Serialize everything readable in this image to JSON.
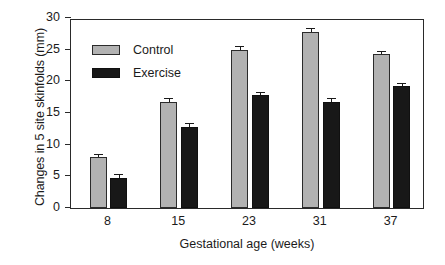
{
  "chart_data": {
    "type": "bar",
    "title": "",
    "xlabel": "Gestational age (weeks)",
    "ylabel": "Changes in 5 site skinfolds (mm)",
    "categories": [
      "8",
      "15",
      "23",
      "31",
      "37"
    ],
    "ylim": [
      0,
      30
    ],
    "yticks": [
      0,
      5,
      10,
      15,
      20,
      25,
      30
    ],
    "ytick_labels": [
      "0",
      "5",
      "10",
      "15",
      "20",
      "25",
      "30"
    ],
    "grid": false,
    "legend_position": "upper-left-inside",
    "series": [
      {
        "name": "Control",
        "color": "#b2b2b2",
        "values": [
          8.0,
          16.8,
          24.9,
          27.8,
          24.3
        ],
        "errors": [
          0.4,
          0.4,
          0.5,
          0.45,
          0.4
        ]
      },
      {
        "name": "Exercise",
        "color": "#181818",
        "values": [
          4.8,
          12.8,
          17.8,
          16.8,
          19.3
        ],
        "errors": [
          0.35,
          0.4,
          0.3,
          0.4,
          0.3
        ]
      }
    ]
  },
  "legend": {
    "items": [
      {
        "label": "Control",
        "swatch": "control"
      },
      {
        "label": "Exercise",
        "swatch": "exercise"
      }
    ]
  }
}
